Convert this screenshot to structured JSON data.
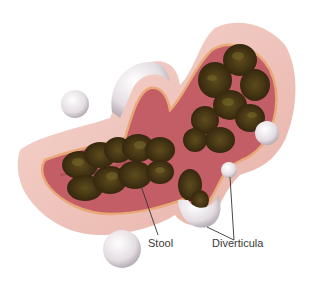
{
  "figure": {
    "colors": {
      "background": "#ffffff",
      "tissue_outer": "#f0c9c0",
      "tissue_inner": "#c9676d",
      "wall_stripe": "#e8a878",
      "stool": "#3b2a12",
      "stool_highlight": "#6b5a22",
      "diverticulum": "#e6e0e4",
      "leader_line": "#333333"
    }
  },
  "labels": {
    "stool": "Stool",
    "diverticula": "Diverticula"
  }
}
